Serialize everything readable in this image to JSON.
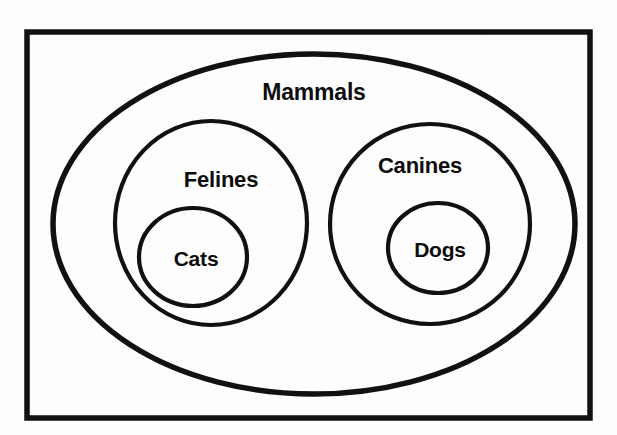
{
  "diagram": {
    "type": "euler-set-containment",
    "background_color": "#fdfdfd",
    "stroke_color": "#111111",
    "text_color": "#0d0d0d",
    "universe": {
      "name": "universe-frame",
      "shape": "rectangle",
      "x": 27,
      "y": 32,
      "width": 563,
      "height": 386,
      "stroke_width": 5.5,
      "label": ""
    },
    "sets": [
      {
        "id": "mammals",
        "label": "Mammals",
        "shape": "ellipse",
        "cx": 314,
        "cy": 224,
        "rx": 261,
        "ry": 170,
        "stroke_width": 5.5,
        "label_x": 314,
        "label_y": 94,
        "level": 1,
        "parent": "universe-frame"
      },
      {
        "id": "felines",
        "label": "Felines",
        "shape": "ellipse",
        "cx": 211,
        "cy": 223,
        "rx": 96,
        "ry": 102,
        "stroke_width": 4.2,
        "label_x": 221,
        "label_y": 181,
        "level": 2,
        "parent": "mammals"
      },
      {
        "id": "canines",
        "label": "Canines",
        "shape": "ellipse",
        "cx": 430,
        "cy": 224,
        "rx": 100,
        "ry": 100,
        "stroke_width": 4.2,
        "label_x": 420,
        "label_y": 167,
        "level": 2,
        "parent": "mammals"
      },
      {
        "id": "cats",
        "label": "Cats",
        "shape": "circle",
        "cx": 193,
        "cy": 257,
        "rx": 54,
        "ry": 49,
        "stroke_width": 4.2,
        "label_x": 196,
        "label_y": 260,
        "level": 3,
        "parent": "felines"
      },
      {
        "id": "dogs",
        "label": "Dogs",
        "shape": "circle",
        "cx": 438,
        "cy": 248,
        "rx": 50,
        "ry": 45,
        "stroke_width": 4.2,
        "label_x": 440,
        "label_y": 251,
        "level": 3,
        "parent": "canines"
      }
    ],
    "labels": {
      "mammals": "Mammals",
      "felines": "Felines",
      "canines": "Canines",
      "cats": "Cats",
      "dogs": "Dogs"
    }
  }
}
